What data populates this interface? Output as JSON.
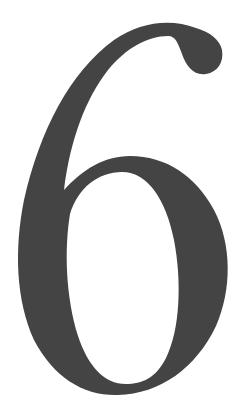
{
  "numeral": {
    "text": "6",
    "color": "#444444",
    "background": "#ffffff"
  }
}
